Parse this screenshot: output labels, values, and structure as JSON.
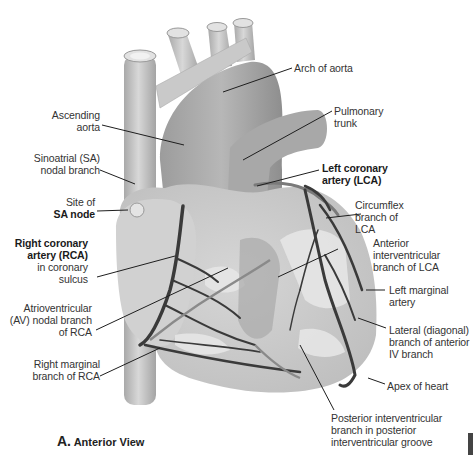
{
  "figure": {
    "title": "Anterior View",
    "panel_letter": "A.",
    "colors": {
      "heart_fill": "#b9b9b9",
      "heart_light": "#dcdcdc",
      "vessel_fill": "#c4c4c4",
      "artery": "#3a3a3a",
      "leader_line": "#1e1e1e",
      "text": "#333333"
    }
  },
  "labels": {
    "arch_of_aorta": [
      "Arch of aorta"
    ],
    "ascending_aorta": [
      "Ascending",
      "aorta"
    ],
    "pulmonary_trunk": [
      "Pulmonary",
      "trunk"
    ],
    "sa_nodal_branch": [
      "Sinoatrial (SA)",
      "nodal branch"
    ],
    "left_coronary_artery": [
      "Left coronary",
      "artery (LCA)"
    ],
    "site_of_sa_node": [
      "Site of",
      "SA node"
    ],
    "circumflex_branch": [
      "Circumflex",
      "branch of",
      "LCA"
    ],
    "right_coronary_artery": [
      "Right coronary",
      "artery (RCA)",
      "in coronary",
      "sulcus"
    ],
    "anterior_interventricular": [
      "Anterior",
      "interventricular",
      "branch of LCA"
    ],
    "av_nodal_branch": [
      "Atrioventricular",
      "(AV) nodal branch",
      "of RCA"
    ],
    "left_marginal_artery": [
      "Left marginal",
      "artery"
    ],
    "lateral_diagonal_branch": [
      "Lateral (diagonal)",
      "branch of anterior",
      "IV branch"
    ],
    "right_marginal_branch": [
      "Right marginal",
      "branch of RCA"
    ],
    "apex_of_heart": [
      "Apex of heart"
    ],
    "posterior_interventricular": [
      "Posterior interventricular",
      "branch in posterior",
      "interventricular groove"
    ]
  }
}
